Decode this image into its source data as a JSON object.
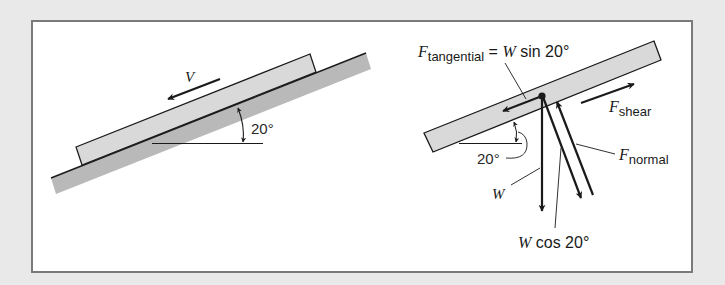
{
  "colors": {
    "background": "#e9e9e9",
    "frame_border": "#7a7a7a",
    "frame_fill": "#ffffff",
    "block_fill": "#d9d9d9",
    "incline_fill": "#b9b9b9",
    "stroke": "#1a1a1a"
  },
  "left_panel": {
    "velocity_label": "V",
    "angle_label": "20°"
  },
  "right_panel": {
    "tangential_label": {
      "symbol": "F",
      "subscript": "tangential",
      "rest": " = ",
      "w": "W",
      "expr": " sin 20°"
    },
    "shear_label": {
      "symbol": "F",
      "subscript": "shear"
    },
    "normal_label": {
      "symbol": "F",
      "subscript": "normal"
    },
    "angle_label": "20°",
    "weight_label": "W",
    "normal_component_label": {
      "w": "W",
      "expr": " cos 20°"
    }
  }
}
